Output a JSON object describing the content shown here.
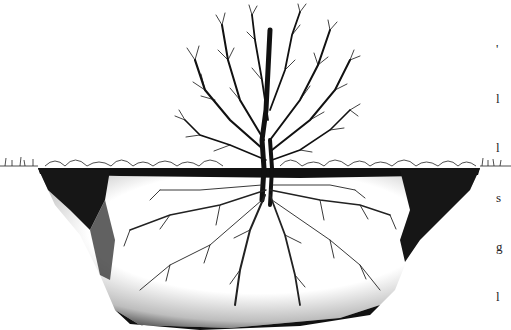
{
  "illustration": {
    "subject": "Pen-and-ink drawing of a leafless tree with its root system spreading through a soil pit",
    "colors": {
      "ink": "#111111",
      "paper": "#ffffff",
      "soil_dark": "#1a1a1a"
    }
  },
  "edge_text": {
    "lines": [
      "'",
      "l",
      "l",
      "s",
      "g",
      "l"
    ]
  }
}
